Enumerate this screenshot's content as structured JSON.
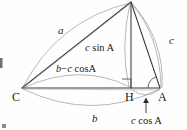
{
  "figure": {
    "type": "geometry-diagram",
    "background_color": "#fefefe",
    "line_color": "#3a3a3a",
    "arc_color": "#8a8a8a",
    "text_color": "#1a1a1a"
  },
  "vertices": {
    "apex_label": "",
    "left_label": "C",
    "right_label": "A",
    "foot_label": "H"
  },
  "labels": {
    "side_a": "a",
    "side_c": "c",
    "altitude": "c sin A",
    "left_segment": "b − c cosA",
    "base_b": "b",
    "right_segment": "c cos A"
  },
  "markers": {
    "right_angle_at": "H",
    "angle_arc_at": "A",
    "arrow_points_to": "c cos A"
  },
  "points": {
    "B": [
      131,
      2
    ],
    "C": [
      22,
      88
    ],
    "A": [
      160,
      88
    ],
    "H": [
      131,
      88
    ]
  }
}
